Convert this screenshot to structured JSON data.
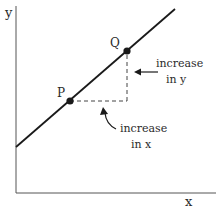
{
  "diagram": {
    "type": "slope-of-line",
    "axes": {
      "x_label": "x",
      "y_label": "y",
      "origin": [
        16,
        193
      ],
      "x_end": [
        216,
        193
      ],
      "y_end": [
        16,
        6
      ]
    },
    "line": {
      "start": [
        16,
        147
      ],
      "end": [
        175,
        9
      ],
      "color": "#1a1a1a"
    },
    "points": [
      {
        "label": "P",
        "at": [
          70,
          101
        ],
        "label_at": [
          57,
          97
        ]
      },
      {
        "label": "Q",
        "at": [
          127,
          51
        ],
        "label_at": [
          110,
          46
        ]
      }
    ],
    "annotations": {
      "increase_in_y": {
        "line1": "increase",
        "line2": "in y"
      },
      "increase_in_x": {
        "line1": "increase",
        "line2": "in x"
      }
    },
    "colors": {
      "stroke": "#1a1a1a",
      "text": "#2a2a2a",
      "axis": "#555555",
      "background": "#ffffff"
    }
  }
}
